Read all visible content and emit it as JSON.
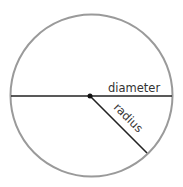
{
  "diagram": {
    "labels": {
      "diameter": "diameter",
      "radius": "radius"
    },
    "circle": {
      "cx": 91.5,
      "cy": 95.5,
      "r": 81,
      "stroke": "#9a9a9a"
    },
    "center_point": {
      "x": 90,
      "y": 96
    },
    "diameter_line": {
      "x1": 11,
      "y1": 96,
      "x2": 172,
      "y2": 96
    },
    "radius_line": {
      "x1": 90,
      "y1": 96,
      "x2": 147,
      "y2": 153
    },
    "colors": {
      "line": "#222222",
      "circle": "#9a9a9a",
      "text": "#333333"
    }
  }
}
